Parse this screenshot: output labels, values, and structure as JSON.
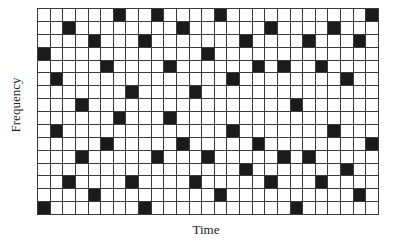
{
  "diagram": {
    "type": "time-frequency-hopping-grid",
    "columns": 27,
    "rows": 16,
    "x_axis_label": "Time",
    "y_axis_label": "Frequency",
    "colors": {
      "filled": "#1b1b1b",
      "empty": "#ffffff",
      "grid_line": "#3a3a3a"
    },
    "filled_cells_by_column": [
      [
        3,
        15
      ],
      [
        5,
        9
      ],
      [
        1,
        13
      ],
      [
        7,
        11
      ],
      [
        2,
        14
      ],
      [
        4,
        10
      ],
      [
        0,
        8
      ],
      [
        6,
        13
      ],
      [
        2,
        15
      ],
      [
        0,
        11
      ],
      [
        4,
        8
      ],
      [
        1,
        10
      ],
      [
        6,
        13
      ],
      [
        3,
        11
      ],
      [
        0,
        14
      ],
      [
        5,
        9
      ],
      [
        2,
        12
      ],
      [
        4,
        10
      ],
      [
        1,
        13
      ],
      [
        4,
        11
      ],
      [
        7,
        15
      ],
      [
        2,
        11
      ],
      [
        4,
        13
      ],
      [
        1,
        9
      ],
      [
        5,
        12
      ],
      [
        2,
        14
      ],
      [
        0,
        10
      ]
    ]
  }
}
